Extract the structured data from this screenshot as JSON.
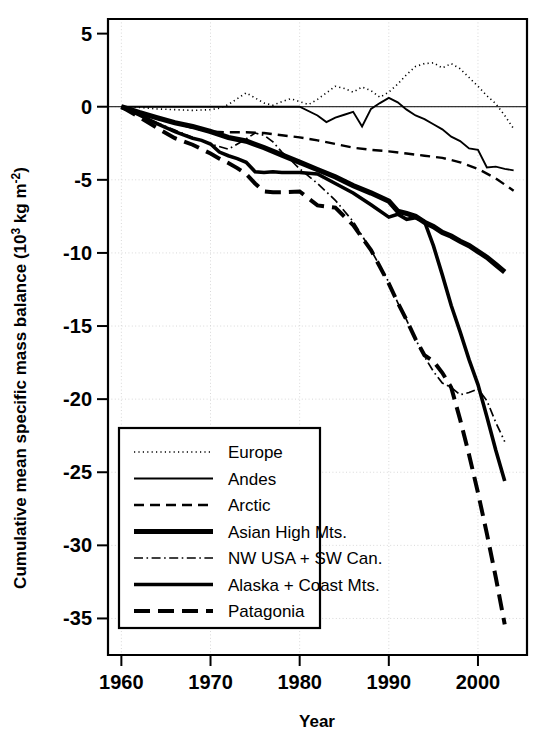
{
  "chart_data": {
    "type": "line",
    "title": "",
    "xlabel": "Year",
    "ylabel": "Cumulative mean specific mass balance (10³ kg m⁻²)",
    "ylabel_parts": {
      "prefix": "Cumulative mean specific mass balance (10",
      "sup1": "3",
      "mid": " kg m",
      "sup2": "-2",
      "suffix": ")"
    },
    "xlim": [
      1958.5,
      2005.5
    ],
    "ylim": [
      -37.5,
      6
    ],
    "xticks": [
      1960,
      1970,
      1980,
      1990,
      2000
    ],
    "xtick_labels": [
      "1960",
      "1970",
      "1980",
      "1990",
      "2000"
    ],
    "yticks": [
      5,
      0,
      -5,
      -10,
      -15,
      -20,
      -25,
      -30,
      -35
    ],
    "ytick_labels": [
      "5",
      "0",
      "-5",
      "-10",
      "-15",
      "-20",
      "-25",
      "-30",
      "-35"
    ],
    "grid": true,
    "grid_color": "#d8d8d8",
    "legend_position": "lower-left-inside",
    "series": [
      {
        "name": "Europe",
        "style": "dotted",
        "stroke_width": 1.6,
        "dash": "1.2 3.2",
        "x": [
          1960,
          1962,
          1964,
          1966,
          1968,
          1970,
          1971,
          1972,
          1973,
          1974,
          1975,
          1976,
          1977,
          1978,
          1979,
          1980,
          1981,
          1982,
          1983,
          1984,
          1985,
          1986,
          1987,
          1988,
          1989,
          1990,
          1991,
          1992,
          1993,
          1994,
          1995,
          1996,
          1997,
          1998,
          1999,
          2000,
          2001,
          2002,
          2003,
          2004
        ],
        "y": [
          0.0,
          -0.05,
          -0.15,
          -0.2,
          -0.25,
          -0.2,
          -0.1,
          0.15,
          0.55,
          0.95,
          0.6,
          0.25,
          0.1,
          0.35,
          0.55,
          0.35,
          0.15,
          0.5,
          0.95,
          1.4,
          1.25,
          1.0,
          1.35,
          1.1,
          0.65,
          1.0,
          1.55,
          2.2,
          2.75,
          2.95,
          3.0,
          2.65,
          2.95,
          2.6,
          2.0,
          1.4,
          0.75,
          0.2,
          -0.6,
          -1.5
        ]
      },
      {
        "name": "Andes",
        "style": "solid-thin",
        "stroke_width": 1.9,
        "dash": "",
        "x": [
          1960,
          1965,
          1970,
          1975,
          1980,
          1982,
          1983,
          1984,
          1985,
          1986,
          1987,
          1988,
          1989,
          1990,
          1991,
          1992,
          1993,
          1994,
          1995,
          1996,
          1997,
          1998,
          1999,
          2000,
          2001,
          2002,
          2003,
          2004
        ],
        "y": [
          0.0,
          0.0,
          0.0,
          0.0,
          0.0,
          -0.6,
          -1.05,
          -0.75,
          -0.55,
          -0.35,
          -1.35,
          -0.15,
          0.25,
          0.6,
          0.3,
          -0.2,
          -0.6,
          -0.85,
          -1.2,
          -1.55,
          -2.05,
          -2.35,
          -2.85,
          -2.95,
          -4.15,
          -4.1,
          -4.25,
          -4.35
        ]
      },
      {
        "name": "Arctic",
        "style": "dashed",
        "stroke_width": 2.4,
        "dash": "10 6",
        "x": [
          1960,
          1962,
          1964,
          1966,
          1968,
          1970,
          1972,
          1974,
          1976,
          1978,
          1980,
          1982,
          1984,
          1986,
          1988,
          1990,
          1992,
          1994,
          1996,
          1998,
          2000,
          2002,
          2004
        ],
        "y": [
          0.0,
          -0.45,
          -0.8,
          -1.1,
          -1.45,
          -1.7,
          -1.75,
          -1.75,
          -1.8,
          -1.95,
          -2.1,
          -2.3,
          -2.55,
          -2.8,
          -2.95,
          -3.05,
          -3.2,
          -3.35,
          -3.5,
          -3.8,
          -4.25,
          -4.9,
          -5.75
        ]
      },
      {
        "name": "Asian High Mts.",
        "style": "solid-thick",
        "stroke_width": 5.2,
        "dash": "",
        "x": [
          1960,
          1962,
          1964,
          1966,
          1968,
          1970,
          1972,
          1974,
          1976,
          1978,
          1980,
          1982,
          1984,
          1986,
          1988,
          1990,
          1991,
          1992,
          1993,
          1994,
          1995,
          1996,
          1997,
          1998,
          1999,
          2000,
          2001,
          2002,
          2003
        ],
        "y": [
          0.0,
          -0.4,
          -0.75,
          -1.1,
          -1.35,
          -1.7,
          -2.1,
          -2.35,
          -2.8,
          -3.3,
          -3.8,
          -4.3,
          -4.8,
          -5.4,
          -5.9,
          -6.45,
          -7.15,
          -7.3,
          -7.5,
          -7.9,
          -8.2,
          -8.6,
          -8.85,
          -9.2,
          -9.5,
          -9.9,
          -10.3,
          -10.8,
          -11.3
        ]
      },
      {
        "name": "NW USA + SW Can.",
        "style": "dash-dot",
        "stroke_width": 1.7,
        "dash": "9 3.5 1.6 3.5",
        "x": [
          1960,
          1962,
          1964,
          1966,
          1968,
          1970,
          1972,
          1974,
          1975,
          1976,
          1977,
          1978,
          1979,
          1980,
          1982,
          1984,
          1986,
          1988,
          1990,
          1991,
          1992,
          1993,
          1994,
          1995,
          1996,
          1997,
          1998,
          1999,
          2000,
          2001,
          2002,
          2003
        ],
        "y": [
          0.0,
          -0.55,
          -1.1,
          -1.6,
          -2.1,
          -2.55,
          -2.9,
          -2.2,
          -1.8,
          -1.95,
          -2.4,
          -3.1,
          -3.65,
          -4.25,
          -5.25,
          -6.4,
          -7.85,
          -9.8,
          -12.0,
          -13.4,
          -14.6,
          -15.9,
          -17.1,
          -18.1,
          -18.9,
          -19.2,
          -19.7,
          -19.55,
          -19.3,
          -20.1,
          -21.6,
          -22.9
        ]
      },
      {
        "name": "Alaska + Coast Mts.",
        "style": "solid-bold",
        "stroke_width": 3.6,
        "dash": "",
        "x": [
          1960,
          1962,
          1964,
          1966,
          1968,
          1969,
          1970,
          1971,
          1972,
          1973,
          1974,
          1975,
          1976,
          1977,
          1978,
          1980,
          1982,
          1984,
          1986,
          1988,
          1990,
          1991,
          1992,
          1993,
          1994,
          1995,
          1996,
          1997,
          1998,
          1999,
          2000,
          2001,
          2002,
          2003
        ],
        "y": [
          0.0,
          -0.55,
          -1.15,
          -1.7,
          -2.15,
          -2.3,
          -2.55,
          -3.1,
          -3.35,
          -3.55,
          -3.8,
          -4.45,
          -4.5,
          -4.45,
          -4.5,
          -4.5,
          -4.6,
          -5.25,
          -5.9,
          -6.7,
          -7.55,
          -7.35,
          -7.7,
          -7.6,
          -7.85,
          -9.5,
          -11.5,
          -13.6,
          -15.4,
          -17.3,
          -19.0,
          -21.2,
          -23.5,
          -25.6
        ]
      },
      {
        "name": "Patagonia",
        "style": "long-dash",
        "stroke_width": 4.0,
        "dash": "16 8",
        "x": [
          1960,
          1962,
          1964,
          1966,
          1968,
          1969,
          1970,
          1971,
          1972,
          1973,
          1974,
          1975,
          1976,
          1977,
          1978,
          1980,
          1982,
          1984,
          1986,
          1988,
          1990,
          1991,
          1992,
          1993,
          1994,
          1995,
          1996,
          1997,
          1998,
          1999,
          2000,
          2001,
          2002,
          2003
        ],
        "y": [
          0.0,
          -0.7,
          -1.45,
          -2.15,
          -2.6,
          -2.9,
          -3.2,
          -3.55,
          -3.85,
          -4.2,
          -4.6,
          -5.25,
          -5.8,
          -5.85,
          -5.85,
          -5.8,
          -6.75,
          -6.9,
          -8.1,
          -9.8,
          -12.1,
          -13.4,
          -14.6,
          -15.9,
          -17.0,
          -17.4,
          -18.2,
          -19.2,
          -21.4,
          -23.8,
          -26.4,
          -29.2,
          -32.2,
          -35.4
        ]
      }
    ]
  },
  "legend": {
    "entries": [
      {
        "label": "Europe"
      },
      {
        "label": "Andes"
      },
      {
        "label": "Arctic"
      },
      {
        "label": "Asian High Mts."
      },
      {
        "label": "NW USA + SW Can."
      },
      {
        "label": "Alaska + Coast Mts."
      },
      {
        "label": "Patagonia"
      }
    ]
  },
  "colors": {
    "line": "#000000",
    "grid": "#d8d8d8",
    "background": "#ffffff"
  }
}
